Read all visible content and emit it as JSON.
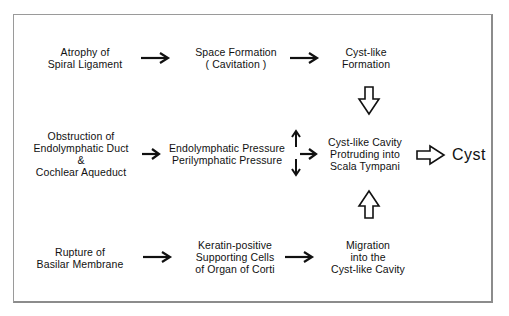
{
  "diagram": {
    "type": "flowchart",
    "rows": [
      {
        "nodes": [
          {
            "id": "atrophy",
            "label": "Atrophy of\nSpiral Ligament"
          },
          {
            "id": "space",
            "label": "Space Formation\n( Cavitation )"
          },
          {
            "id": "cystlike_formation",
            "label": "Cyst-like\nFormation"
          }
        ]
      },
      {
        "nodes": [
          {
            "id": "obstruction",
            "label": "Obstruction of\nEndolymphatic Duct\n&\nCochlear Aqueduct"
          },
          {
            "id": "pressure",
            "label": "Endolymphatic Pressure\nPerilymphatic Pressure"
          },
          {
            "id": "cavity",
            "label": "Cyst-like Cavity\nProtruding into\nScala Tympani"
          },
          {
            "id": "cyst",
            "label": "Cyst"
          }
        ]
      },
      {
        "nodes": [
          {
            "id": "rupture",
            "label": "Rupture of\nBasilar Membrane"
          },
          {
            "id": "keratin",
            "label": "Keratin-positive\nSupporting Cells\nof Organ of Corti"
          },
          {
            "id": "migration",
            "label": "Migration\ninto the\nCyst-like Cavity"
          }
        ]
      }
    ],
    "edges": [
      {
        "from": "atrophy",
        "to": "space",
        "style": "solid-arrow"
      },
      {
        "from": "space",
        "to": "cystlike_formation",
        "style": "solid-arrow"
      },
      {
        "from": "cystlike_formation",
        "to": "cavity",
        "style": "hollow-arrow-down"
      },
      {
        "from": "obstruction",
        "to": "pressure",
        "style": "solid-arrow"
      },
      {
        "from": "pressure",
        "to": "cavity",
        "style": "solid-arrow",
        "note": "pressure indicators: endolymphatic up, perilymphatic down"
      },
      {
        "from": "cavity",
        "to": "cyst",
        "style": "hollow-arrow-right"
      },
      {
        "from": "rupture",
        "to": "keratin",
        "style": "solid-arrow"
      },
      {
        "from": "keratin",
        "to": "migration",
        "style": "solid-arrow"
      },
      {
        "from": "migration",
        "to": "cavity",
        "style": "hollow-arrow-up"
      }
    ],
    "colors": {
      "text": "#111111",
      "frame": "#9a9a9a",
      "background": "#ffffff"
    }
  }
}
